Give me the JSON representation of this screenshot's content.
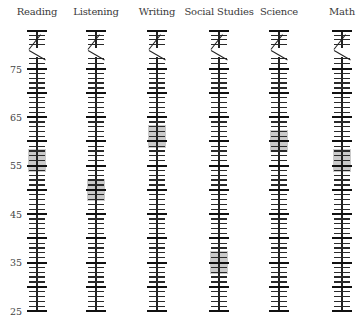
{
  "chart_data": {
    "type": "score-profile",
    "title": "",
    "categories": [
      "Reading",
      "Listening",
      "Writing",
      "Social Studies",
      "Science",
      "Math"
    ],
    "values": [
      56,
      50,
      61,
      35,
      60,
      56
    ],
    "band_halfwidth": 2.3,
    "ylabel": "",
    "y_tick_labels": [
      75,
      65,
      55,
      45,
      35,
      25
    ],
    "ylim": [
      25,
      75
    ],
    "axis_break": "above 75",
    "minor_tick_step": 1,
    "major_tick_step": 5,
    "grid": false,
    "legend": null
  },
  "columns": [
    {
      "label": "Reading",
      "x": 37
    },
    {
      "label": "Listening",
      "x": 96
    },
    {
      "label": "Writing",
      "x": 157
    },
    {
      "label": "Social Studies",
      "x": 219
    },
    {
      "label": "Science",
      "x": 279
    },
    {
      "label": "Math",
      "x": 342
    }
  ],
  "axis": {
    "labels": [
      "75",
      "65",
      "55",
      "45",
      "35",
      "25"
    ]
  },
  "colors": {
    "ink": "#222222",
    "band": "#9a9a9a",
    "background": "#ffffff"
  }
}
